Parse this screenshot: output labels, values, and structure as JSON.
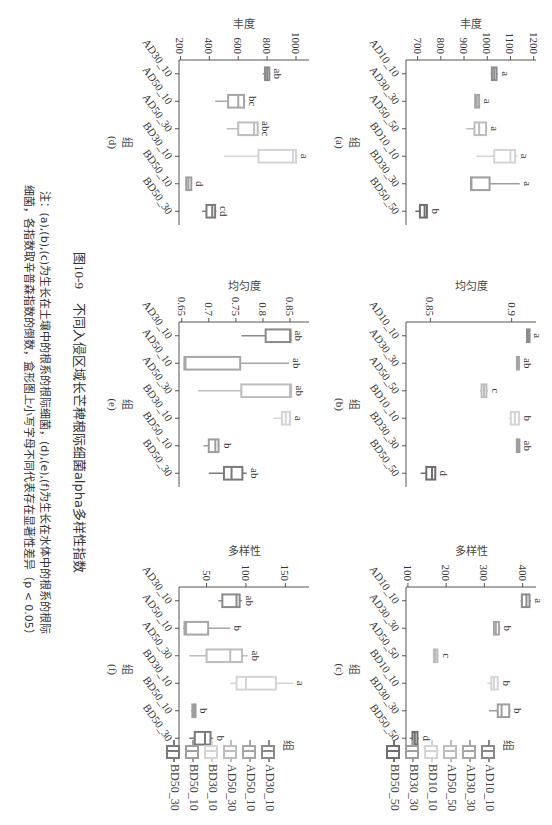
{
  "figure": {
    "number": "图10-9",
    "title": "不同入侵区域长芒稗根际细菌alpha多样性指数",
    "note_line1": "注：(a),(b),(c)为生长在土壤中的根系的根际细菌，(d),(e),(f)为生长在水体中的根系的根际",
    "note_line2": "细菌，各指数取辛普森指数的倒数，盒形图上小写字母不同代表存在显著性差异（p < 0.05）"
  },
  "legend_soil": {
    "title": "组",
    "items": [
      "AD10_10",
      "AD30_30",
      "AD50_50",
      "BD10_10",
      "BD30_30",
      "BD50_50"
    ]
  },
  "legend_water": {
    "title": "组",
    "items": [
      "AD30_10",
      "AD50_10",
      "AD50_30",
      "BD30_10",
      "BD50_10",
      "BD50_30"
    ]
  },
  "colors": {
    "soil": [
      "#8a8a8a",
      "#a6a6a6",
      "#bdbdbd",
      "#d4d4d4",
      "#9e9e9e",
      "#6e6e6e"
    ],
    "water": [
      "#8a8a8a",
      "#a6a6a6",
      "#bdbdbd",
      "#d4d4d4",
      "#9e9e9e",
      "#7a7a7a"
    ]
  },
  "chart_data": [
    {
      "id": "a",
      "panel_label": "(a)",
      "type": "box",
      "ylabel": "丰度",
      "xlabel": "组",
      "ylim": [
        650,
        1210
      ],
      "yticks": [
        700,
        800,
        900,
        1000,
        1100,
        1200
      ],
      "categories": [
        "AD10_10",
        "AD30_30",
        "AD50_50",
        "BD10_10",
        "BD30_30",
        "BD50_50"
      ],
      "boxes": [
        {
          "min": 1015,
          "q1": 1020,
          "median": 1030,
          "q3": 1040,
          "max": 1045,
          "letter": "a"
        },
        {
          "min": 945,
          "q1": 948,
          "median": 955,
          "q3": 965,
          "max": 968,
          "letter": "a"
        },
        {
          "min": 910,
          "q1": 945,
          "median": 965,
          "q3": 995,
          "max": 1000,
          "letter": "a"
        },
        {
          "min": 955,
          "q1": 1030,
          "median": 1100,
          "q3": 1120,
          "max": 1130,
          "letter": "a"
        },
        {
          "min": 925,
          "q1": 930,
          "median": 932,
          "q3": 1010,
          "max": 1140,
          "letter": "a"
        },
        {
          "min": 690,
          "q1": 710,
          "median": 730,
          "q3": 740,
          "max": 745,
          "letter": "b"
        }
      ]
    },
    {
      "id": "b",
      "panel_label": "(b)",
      "type": "box",
      "ylabel": "均匀度",
      "xlabel": "组",
      "ylim": [
        0.835,
        0.915
      ],
      "yticks": [
        0.85,
        0.9
      ],
      "categories": [
        "AD10_10",
        "AD30_30",
        "AD50_50",
        "BD10_10",
        "BD30_30",
        "BD50_50"
      ],
      "boxes": [
        {
          "min": 0.909,
          "q1": 0.9095,
          "median": 0.91,
          "q3": 0.911,
          "max": 0.9115,
          "letter": "a"
        },
        {
          "min": 0.903,
          "q1": 0.9035,
          "median": 0.904,
          "q3": 0.9045,
          "max": 0.905,
          "letter": "ab"
        },
        {
          "min": 0.8805,
          "q1": 0.8815,
          "median": 0.883,
          "q3": 0.8845,
          "max": 0.8855,
          "letter": "c"
        },
        {
          "min": 0.8985,
          "q1": 0.8995,
          "median": 0.902,
          "q3": 0.9045,
          "max": 0.905,
          "letter": "b"
        },
        {
          "min": 0.903,
          "q1": 0.9032,
          "median": 0.904,
          "q3": 0.9048,
          "max": 0.905,
          "letter": "ab"
        },
        {
          "min": 0.844,
          "q1": 0.8475,
          "median": 0.851,
          "q3": 0.853,
          "max": 0.8535,
          "letter": "d"
        }
      ]
    },
    {
      "id": "c",
      "panel_label": "(c)",
      "type": "box",
      "ylabel": "多样性",
      "xlabel": "组",
      "ylim": [
        95,
        435
      ],
      "yticks": [
        100,
        200,
        300,
        400
      ],
      "categories": [
        "AD10_10",
        "AD30_30",
        "AD50_50",
        "BD10_10",
        "BD30_30",
        "BD50_50"
      ],
      "boxes": [
        {
          "min": 395,
          "q1": 398,
          "median": 410,
          "q3": 418,
          "max": 422,
          "letter": "a"
        },
        {
          "min": 323,
          "q1": 325,
          "median": 330,
          "q3": 338,
          "max": 342,
          "letter": "b"
        },
        {
          "min": 167,
          "q1": 168,
          "median": 172,
          "q3": 177,
          "max": 180,
          "letter": "c"
        },
        {
          "min": 308,
          "q1": 318,
          "median": 325,
          "q3": 335,
          "max": 338,
          "letter": "b"
        },
        {
          "min": 312,
          "q1": 335,
          "median": 345,
          "q3": 365,
          "max": 368,
          "letter": "b"
        },
        {
          "min": 105,
          "q1": 112,
          "median": 118,
          "q3": 125,
          "max": 128,
          "letter": "d"
        }
      ]
    },
    {
      "id": "d",
      "panel_label": "(d)",
      "type": "box",
      "ylabel": "丰度",
      "xlabel": "组",
      "ylim": [
        190,
        1090
      ],
      "yticks": [
        200,
        400,
        600,
        800,
        1000
      ],
      "categories": [
        "AD30_10",
        "AD50_10",
        "AD50_30",
        "BD30_10",
        "BD50_10",
        "BD50_30"
      ],
      "boxes": [
        {
          "min": 770,
          "q1": 785,
          "median": 800,
          "q3": 815,
          "max": 822,
          "letter": "ab"
        },
        {
          "min": 440,
          "q1": 530,
          "median": 600,
          "q3": 640,
          "max": 650,
          "letter": "bc"
        },
        {
          "min": 520,
          "q1": 600,
          "median": 710,
          "q3": 735,
          "max": 740,
          "letter": "abc"
        },
        {
          "min": 500,
          "q1": 740,
          "median": 980,
          "q3": 1000,
          "max": 1010,
          "letter": "a"
        },
        {
          "min": 235,
          "q1": 240,
          "median": 255,
          "q3": 275,
          "max": 278,
          "letter": "d"
        },
        {
          "min": 350,
          "q1": 380,
          "median": 420,
          "q3": 440,
          "max": 448,
          "letter": "cd"
        }
      ]
    },
    {
      "id": "e",
      "panel_label": "(e)",
      "type": "box",
      "ylabel": "均匀度",
      "xlabel": "组",
      "ylim": [
        0.645,
        0.885
      ],
      "yticks": [
        0.65,
        0.7,
        0.75,
        0.8,
        0.85
      ],
      "categories": [
        "AD30_10",
        "AD50_10",
        "AD50_30",
        "BD30_10",
        "BD50_10",
        "BD50_30"
      ],
      "boxes": [
        {
          "min": 0.76,
          "q1": 0.805,
          "median": 0.85,
          "q3": 0.851,
          "max": 0.852,
          "letter": "ab"
        },
        {
          "min": 0.653,
          "q1": 0.655,
          "median": 0.657,
          "q3": 0.758,
          "max": 0.848,
          "letter": "ab"
        },
        {
          "min": 0.68,
          "q1": 0.76,
          "median": 0.85,
          "q3": 0.852,
          "max": 0.853,
          "letter": "ab"
        },
        {
          "min": 0.82,
          "q1": 0.835,
          "median": 0.842,
          "q3": 0.85,
          "max": 0.851,
          "letter": "a"
        },
        {
          "min": 0.69,
          "q1": 0.7,
          "median": 0.712,
          "q3": 0.718,
          "max": 0.72,
          "letter": "b"
        },
        {
          "min": 0.7,
          "q1": 0.728,
          "median": 0.742,
          "q3": 0.762,
          "max": 0.77,
          "letter": "ab"
        }
      ]
    },
    {
      "id": "f",
      "panel_label": "(f)",
      "type": "box",
      "ylabel": "多样性",
      "xlabel": "组",
      "ylim": [
        15,
        180
      ],
      "yticks": [
        50,
        100,
        150
      ],
      "categories": [
        "AD30_10",
        "AD50_10",
        "AD50_30",
        "BD30_10",
        "BD50_10",
        "BD50_30"
      ],
      "boxes": [
        {
          "min": 65,
          "q1": 70,
          "median": 88,
          "q3": 92,
          "max": 95,
          "letter": "ab"
        },
        {
          "min": 20,
          "q1": 22,
          "median": 24,
          "q3": 52,
          "max": 80,
          "letter": "b"
        },
        {
          "min": 28,
          "q1": 50,
          "median": 80,
          "q3": 95,
          "max": 102,
          "letter": "ab"
        },
        {
          "min": 80,
          "q1": 88,
          "median": 100,
          "q3": 138,
          "max": 160,
          "letter": "a"
        },
        {
          "min": 30,
          "q1": 32,
          "median": 34,
          "q3": 36,
          "max": 37,
          "letter": "b"
        },
        {
          "min": 28,
          "q1": 35,
          "median": 48,
          "q3": 55,
          "max": 58,
          "letter": "b"
        }
      ]
    }
  ]
}
